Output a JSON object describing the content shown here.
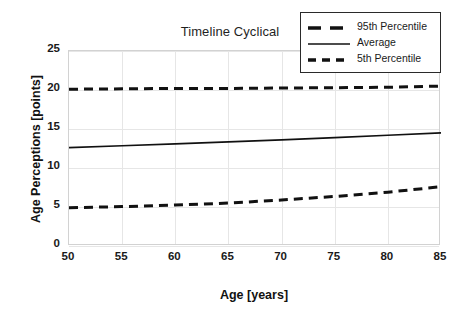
{
  "chart_data": {
    "type": "line",
    "title": "Timeline Cyclical",
    "xlabel": "Age [years]",
    "ylabel": "Age Perceptions [points]",
    "xlim": [
      50,
      85
    ],
    "ylim": [
      0,
      25
    ],
    "grid": true,
    "legend_position": "top-right",
    "xticks": [
      "50",
      "55",
      "60",
      "65",
      "70",
      "75",
      "80",
      "85"
    ],
    "yticks": [
      "0",
      "5",
      "10",
      "15",
      "20",
      "25"
    ],
    "x": [
      50,
      55,
      60,
      65,
      70,
      75,
      80,
      85
    ],
    "series": [
      {
        "name": "95th Percentile",
        "style": "dashed",
        "color": "#111111",
        "values": [
          20.1,
          20.15,
          20.2,
          20.2,
          20.25,
          20.3,
          20.35,
          20.5
        ]
      },
      {
        "name": "Average",
        "style": "solid",
        "color": "#111111",
        "values": [
          12.6,
          12.85,
          13.1,
          13.35,
          13.6,
          13.9,
          14.2,
          14.5
        ]
      },
      {
        "name": "5th Percentile",
        "style": "dashed",
        "color": "#111111",
        "values": [
          4.9,
          5.05,
          5.25,
          5.5,
          5.9,
          6.35,
          6.9,
          7.6
        ]
      }
    ]
  },
  "legend": {
    "items": [
      {
        "label": "95th Percentile"
      },
      {
        "label": "Average"
      },
      {
        "label": "5th Percentile"
      }
    ]
  }
}
